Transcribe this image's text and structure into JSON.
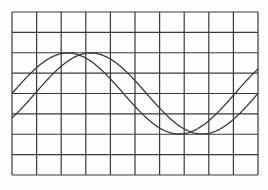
{
  "figure": {
    "background": "#fdfdfd",
    "line_color": "#3a3a3a",
    "curve_color": "#3a3a3a"
  },
  "grid": {
    "x0": 12,
    "y0": 12,
    "x1": 258,
    "y1": 175,
    "columns": 10,
    "rows": 8,
    "stroke_width": 1.2
  },
  "waves": [
    {
      "name": "wave-a",
      "center_y": 93.5,
      "amplitude": 40.5,
      "period": 223,
      "zero_x": 12,
      "stroke_width": 1.3
    },
    {
      "name": "wave-b",
      "center_y": 93.5,
      "amplitude": 40.5,
      "period": 223,
      "zero_x": 35,
      "stroke_width": 1.3
    }
  ]
}
